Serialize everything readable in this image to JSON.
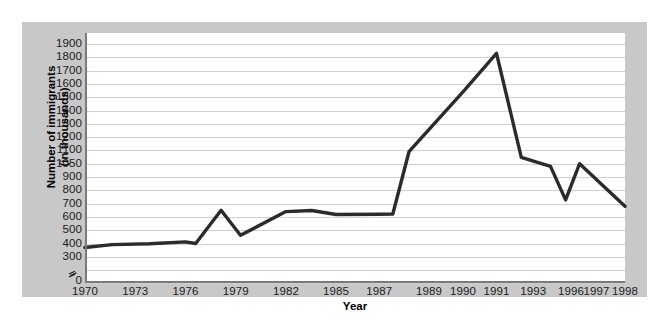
{
  "chart_data": {
    "type": "line",
    "title": "",
    "xlabel": "Year",
    "ylabel": "Number of immigrants\n(in thousands)",
    "ylabel_line1": "Number of immigrants",
    "ylabel_line2": "(in thousands)",
    "categories": [
      "1970",
      "1973",
      "1976",
      "1979",
      "1982",
      "1985",
      "1987",
      "1989",
      "1990",
      "1991",
      "1993",
      "1996",
      "1997",
      "1998"
    ],
    "values": [
      370,
      400,
      400,
      650,
      640,
      620,
      620,
      1090,
      1540,
      1830,
      1050,
      900,
      900,
      680
    ],
    "series": [
      {
        "name": "Number of immigrants (in thousands)",
        "values": [
          370,
          400,
          400,
          650,
          640,
          620,
          620,
          1090,
          1540,
          1830,
          1050,
          900,
          900,
          680
        ]
      }
    ],
    "ytick_labels": [
      "1900",
      "1800",
      "1700",
      "1600",
      "1500",
      "1400",
      "1300",
      "1200",
      "1100",
      "1050",
      "900",
      "800",
      "700",
      "600",
      "500",
      "400",
      "300",
      "0"
    ],
    "ytick_values": [
      1900,
      1800,
      1700,
      1600,
      1500,
      1400,
      1300,
      1200,
      1100,
      1000,
      900,
      800,
      700,
      600,
      500,
      400,
      300,
      0
    ],
    "ylim": [
      300,
      1900
    ],
    "axis_break": true,
    "axis_break_symbol": "≈",
    "grid": true,
    "legend": "none",
    "line_color": "#2b2b2b",
    "plot_background": "#ffffff",
    "figure_background": "#c8c8c8",
    "grid_color": "#d0d0d0",
    "axis_color": "#7a7a7a"
  }
}
